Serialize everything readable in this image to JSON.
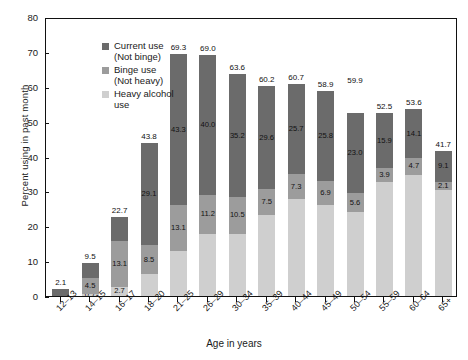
{
  "chart_data": {
    "type": "bar",
    "title": "",
    "subtitle": "",
    "xlabel": "Age in years",
    "ylabel": "Percent using in past month",
    "ylim": [
      0,
      80
    ],
    "yticks": [
      0,
      10,
      20,
      30,
      40,
      50,
      60,
      70,
      80
    ],
    "grid": false,
    "stacked": true,
    "legend_position": "top-left",
    "categories": [
      "12–13",
      "14–15",
      "16–17",
      "18–20",
      "21–25",
      "26–29",
      "30–34",
      "35–39",
      "40–44",
      "45–49",
      "50–54",
      "55–59",
      "60–64",
      "65+"
    ],
    "series": [
      {
        "name": "Heavy alcohol use",
        "color": "#cfcfcf",
        "values": [
          0.0,
          0.7,
          2.7,
          6.2,
          12.9,
          17.8,
          17.9,
          23.1,
          27.7,
          26.2,
          24.0,
          32.7,
          34.8,
          30.5
        ],
        "labels": [
          "",
          "0.7",
          "2.7",
          "",
          "",
          "",
          "",
          "",
          "",
          "",
          "",
          "",
          "",
          ""
        ]
      },
      {
        "name": "Binge use (Not heavy)",
        "color": "#9c9c9c",
        "values": [
          0.0,
          4.5,
          13.1,
          8.5,
          13.1,
          11.2,
          10.5,
          7.5,
          7.3,
          6.9,
          5.6,
          3.9,
          4.7,
          2.1
        ],
        "labels": [
          "",
          "4.5",
          "13.1",
          "8.5",
          "13.1",
          "11.2",
          "10.5",
          "7.5",
          "7.3",
          "6.9",
          "5.6",
          "3.9",
          "4.7",
          "2.1"
        ]
      },
      {
        "name": "Current use (Not binge)",
        "color": "#6b6b6b",
        "values": [
          2.1,
          4.3,
          6.9,
          29.1,
          43.3,
          40.0,
          35.2,
          29.6,
          25.7,
          25.8,
          23.0,
          15.9,
          14.1,
          9.1
        ],
        "labels": [
          "",
          "",
          "",
          "29.1",
          "43.3",
          "40.0",
          "35.2",
          "29.6",
          "25.7",
          "25.8",
          "23.0",
          "15.9",
          "14.1",
          "9.1"
        ]
      }
    ],
    "totals": [
      2.1,
      9.5,
      22.7,
      43.8,
      69.3,
      69.0,
      63.6,
      60.2,
      60.7,
      58.9,
      59.9,
      52.5,
      53.6,
      41.7
    ]
  },
  "legend": {
    "items": [
      {
        "label": "Current use\n(Not binge)",
        "color": "#6b6b6b",
        "swatch_class": "sw-current"
      },
      {
        "label": "Binge use\n(Not heavy)",
        "color": "#9c9c9c",
        "swatch_class": "sw-binge"
      },
      {
        "label": "Heavy alcohol\nuse",
        "color": "#cfcfcf",
        "swatch_class": "sw-heavy"
      }
    ]
  }
}
